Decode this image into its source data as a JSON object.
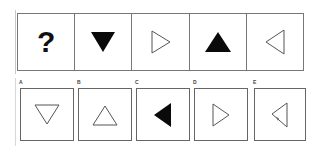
{
  "question": {
    "sequence": [
      {
        "type": "placeholder",
        "text": "?"
      },
      {
        "type": "triangle",
        "direction": "down",
        "fill": "black"
      },
      {
        "type": "triangle",
        "direction": "right",
        "fill": "outline"
      },
      {
        "type": "triangle",
        "direction": "up",
        "fill": "black"
      },
      {
        "type": "triangle",
        "direction": "left",
        "fill": "outline"
      }
    ],
    "placeholder_text": "?"
  },
  "options": [
    {
      "label": "A",
      "shape": "triangle",
      "direction": "down",
      "fill": "outline"
    },
    {
      "label": "B",
      "shape": "triangle",
      "direction": "up",
      "fill": "outline"
    },
    {
      "label": "C",
      "shape": "triangle",
      "direction": "left",
      "fill": "black"
    },
    {
      "label": "D",
      "shape": "triangle",
      "direction": "right",
      "fill": "outline"
    },
    {
      "label": "E",
      "shape": "triangle",
      "direction": "left",
      "fill": "outline"
    }
  ],
  "colors": {
    "stroke": "#555555",
    "fill_black": "#0a0a0a",
    "border": "#777777"
  }
}
